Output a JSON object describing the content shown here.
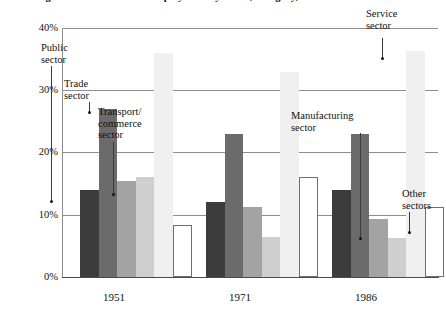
{
  "chart_data": {
    "type": "bar",
    "title": "Figure 1.  Distribution of employment by sector, Hungary, 1951–1986",
    "xlabel": "",
    "ylabel": "",
    "ylim": [
      0,
      40
    ],
    "yticks": [
      "0%",
      "10%",
      "20%",
      "30%",
      "40%"
    ],
    "ytick_values": [
      0,
      10,
      20,
      30,
      40
    ],
    "grid": true,
    "legend_position": "none (inline annotations with leader lines)",
    "categories": [
      "1951",
      "1971",
      "1986"
    ],
    "series": [
      {
        "name": "Public sector",
        "values": [
          14.0,
          12.0,
          14.0
        ],
        "color": "#3c3c3c"
      },
      {
        "name": "Trade sector",
        "values": [
          27.0,
          23.0,
          23.0
        ],
        "color": "#6b6b6b"
      },
      {
        "name": "Transport/commerce sector",
        "values": [
          15.5,
          11.2,
          9.3
        ],
        "color": "#a3a3a3"
      },
      {
        "name": "Manufacturing sector",
        "values": [
          16.0,
          6.5,
          6.3
        ],
        "color": "#cfcfcf"
      },
      {
        "name": "Service sector",
        "values": [
          36.0,
          33.0,
          36.3
        ],
        "color": "#f0f0f0"
      },
      {
        "name": "Other sectors",
        "values": [
          8.3,
          16.0,
          11.2
        ],
        "color": "#ffffff"
      }
    ],
    "annotations": [
      {
        "text": "Public\nsector",
        "series": "Public sector",
        "group": "1951"
      },
      {
        "text": "Trade\nsector",
        "series": "Trade sector",
        "group": "1951"
      },
      {
        "text": "Transport/\ncommerce\nsector",
        "series": "Transport/commerce sector",
        "group": "1951"
      },
      {
        "text": "Manufacturing\nsector",
        "series": "Manufacturing sector",
        "group": "1986"
      },
      {
        "text": "Service\nsector",
        "series": "Service sector",
        "group": "1986"
      },
      {
        "text": "Other\nsectors",
        "series": "Other sectors",
        "group": "1986"
      }
    ]
  }
}
